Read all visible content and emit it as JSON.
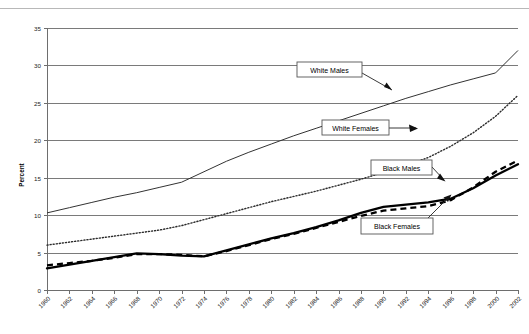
{
  "chart_data": {
    "type": "line",
    "title": "",
    "subtitle": "",
    "xlabel": "",
    "ylabel": "Percent",
    "ylim": [
      0,
      35
    ],
    "ytick_step": 5,
    "yticks": [
      "0",
      "5",
      "10",
      "15",
      "20",
      "25",
      "30",
      "35"
    ],
    "grid": true,
    "legend_position": "inline-callouts",
    "x": [
      1960,
      1962,
      1964,
      1966,
      1968,
      1970,
      1972,
      1974,
      1976,
      1978,
      1980,
      1982,
      1984,
      1986,
      1988,
      1990,
      1992,
      1994,
      1996,
      1998,
      2000,
      2002
    ],
    "categories": [
      "1960",
      "1962",
      "1964",
      "1966",
      "1968",
      "1970",
      "1972",
      "1974",
      "1976",
      "1978",
      "1980",
      "1982",
      "1984",
      "1986",
      "1988",
      "1990",
      "1992",
      "1994",
      "1996",
      "1998",
      "2000",
      "2002"
    ],
    "series": [
      {
        "name": "White Males",
        "style": "thin-solid",
        "values": [
          10.3,
          11.0,
          11.7,
          12.4,
          13.0,
          13.7,
          14.4,
          15.8,
          17.2,
          18.4,
          19.5,
          20.6,
          21.6,
          22.6,
          23.6,
          24.6,
          25.6,
          26.5,
          27.4,
          28.2,
          29.0,
          32.0
        ]
      },
      {
        "name": "White Females",
        "style": "dotted",
        "values": [
          6.0,
          6.4,
          6.8,
          7.2,
          7.6,
          8.0,
          8.6,
          9.4,
          10.2,
          11.0,
          11.8,
          12.5,
          13.2,
          14.0,
          14.8,
          15.7,
          16.6,
          17.7,
          19.2,
          21.0,
          23.2,
          26.0
        ]
      },
      {
        "name": "Black Males",
        "style": "thick-solid",
        "values": [
          2.9,
          3.4,
          3.9,
          4.4,
          4.9,
          4.8,
          4.6,
          4.5,
          5.3,
          6.1,
          6.9,
          7.6,
          8.4,
          9.3,
          10.3,
          11.1,
          11.4,
          11.7,
          12.2,
          13.6,
          15.3,
          16.8
        ]
      },
      {
        "name": "Black Females",
        "style": "thick-dashed",
        "values": [
          3.3,
          3.6,
          3.9,
          4.3,
          4.8,
          4.8,
          4.7,
          4.5,
          5.2,
          6.0,
          6.8,
          7.5,
          8.3,
          9.1,
          9.9,
          10.6,
          10.9,
          11.2,
          12.0,
          13.7,
          15.8,
          17.3
        ]
      }
    ],
    "annotations": [
      {
        "label": "White Males",
        "target_series": "White Males"
      },
      {
        "label": "White Females",
        "target_series": "White Females"
      },
      {
        "label": "Black Males",
        "target_series": "Black Males"
      },
      {
        "label": "Black Females",
        "target_series": "Black Females"
      }
    ]
  },
  "axis": {
    "y_title": "Percent"
  }
}
